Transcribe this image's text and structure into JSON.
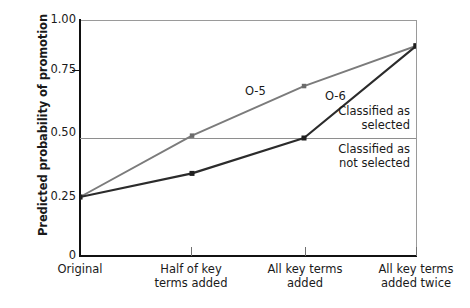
{
  "chart_data": {
    "type": "line",
    "title": "",
    "xlabel": "",
    "ylabel": "Predicted probability of promotion",
    "categories": [
      "Original",
      "Half of key terms added",
      "All key terms added",
      "All key terms added twice"
    ],
    "category_lines": [
      [
        "Original"
      ],
      [
        "Half of key",
        "terms added"
      ],
      [
        "All key terms",
        "added"
      ],
      [
        "All key terms",
        "added twice"
      ]
    ],
    "series": [
      {
        "name": "O-5",
        "color": "#7b7b7b",
        "values": [
          0.25,
          0.51,
          0.72,
          0.89
        ]
      },
      {
        "name": "O-6",
        "color": "#2b2b2b",
        "values": [
          0.25,
          0.35,
          0.5,
          0.89
        ]
      }
    ],
    "ylim": [
      0,
      1.0
    ],
    "yticks": [
      0,
      0.25,
      0.5,
      0.75,
      1.0
    ],
    "ytick_labels": [
      "0",
      "0.25",
      "0.50",
      "0.75",
      "1.00"
    ],
    "grid": false,
    "legend": "inline-series-labels",
    "threshold": {
      "value": 0.5,
      "color": "#8e8e8e",
      "above_label": [
        "Classified as",
        "selected"
      ],
      "below_label": [
        "Classified as",
        "not selected"
      ]
    }
  },
  "axis": {
    "y_title": "Predicted probability of promotion",
    "tick_1_00": "1.00",
    "tick_0_75": "0.75",
    "tick_0_50": "0.50",
    "tick_0_25": "0.25",
    "tick_0": "0"
  },
  "x_labels": {
    "c0_l0": "Original",
    "c1_l0": "Half of key",
    "c1_l1": "terms added",
    "c2_l0": "All key terms",
    "c2_l1": "added",
    "c3_l0": "All key terms",
    "c3_l1": "added twice"
  },
  "series_labels": {
    "o5": "O-5",
    "o6": "O-6"
  },
  "annotations": {
    "selected_l0": "Classified as",
    "selected_l1": "selected",
    "not_selected_l0": "Classified as",
    "not_selected_l1": "not selected"
  },
  "colors": {
    "o5_line": "#7b7b7b",
    "o6_line": "#2b2b2b",
    "axis": "#111111",
    "threshold": "#8e8e8e",
    "frame": "#9a9a9a"
  }
}
